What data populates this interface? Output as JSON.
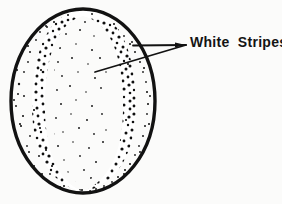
{
  "figure": {
    "type": "stippled-line-drawing",
    "background_color": "#fbfbfa",
    "ink_color": "#141414",
    "callout": {
      "label": "White Stripes",
      "leader_style": "two-pronged converging lines",
      "converge_point": [
        186,
        45
      ],
      "prongs": [
        {
          "name": "upper-prong",
          "from": [
            186,
            45
          ],
          "to": [
            133,
            45
          ]
        },
        {
          "name": "lower-prong",
          "from": [
            186,
            45
          ],
          "to": [
            95,
            72
          ]
        }
      ]
    },
    "outline": {
      "name": "seed-outline",
      "center": [
        83,
        101
      ],
      "radius_x": 73,
      "radius_y": 93,
      "stroke_width": 3.2
    },
    "bands": [
      {
        "name": "left-dark-band",
        "x_range": [
          34,
          60
        ],
        "shade": "dense"
      },
      {
        "name": "center-white-stripe",
        "x_range": [
          60,
          104
        ],
        "shade": "sparse"
      },
      {
        "name": "right-dark-band",
        "x_range": [
          104,
          136
        ],
        "shade": "dense"
      },
      {
        "name": "outer-margin",
        "shade": "very-sparse"
      }
    ]
  }
}
